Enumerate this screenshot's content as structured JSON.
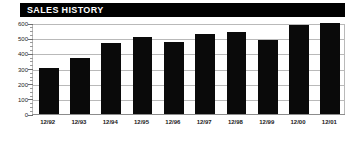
{
  "header": {
    "title": "SALES HISTORY",
    "background_color": "#000000",
    "text_color": "#ffffff"
  },
  "chart_data": {
    "type": "bar",
    "title": "SALES HISTORY",
    "subtitle": "",
    "xlabel": "",
    "ylabel": "",
    "categories": [
      "12/92",
      "12/93",
      "12/94",
      "12/95",
      "12/96",
      "12/97",
      "12/98",
      "12/99",
      "12/00",
      "12/01"
    ],
    "values": [
      305,
      370,
      470,
      510,
      477,
      530,
      540,
      490,
      585,
      598
    ],
    "ylim": [
      0,
      600
    ],
    "xlim_categories": 10,
    "yticks": [
      0,
      100,
      200,
      300,
      400,
      500,
      600
    ],
    "ytick_labels": [
      "0",
      "100",
      "200",
      "300",
      "400",
      "500",
      "600"
    ],
    "grid": true,
    "grid_axis": "y",
    "grid_color": "#b9b9b9",
    "legend": false,
    "legend_position": "none",
    "bar_color": "#0a0a0a",
    "background_color": "#ffffff",
    "annotations": []
  }
}
